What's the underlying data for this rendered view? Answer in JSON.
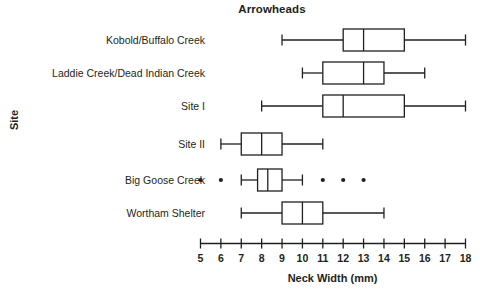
{
  "chart_data": {
    "type": "box",
    "title": "Arrowheads",
    "xlabel": "Neck Width (mm)",
    "ylabel": "Site",
    "xlim": [
      5,
      18
    ],
    "xticks": [
      5,
      6,
      7,
      8,
      9,
      10,
      11,
      12,
      13,
      14,
      15,
      16,
      17,
      18
    ],
    "xtick_labels": [
      "5",
      "6",
      "7",
      "8",
      "9",
      "10",
      "11",
      "12",
      "13",
      "14",
      "15",
      "16",
      "17",
      "18"
    ],
    "grid": false,
    "legend": null,
    "orientation": "horizontal",
    "categories": [
      "Kobold/Buffalo Creek",
      "Laddie Creek/Dead Indian Creek",
      "Site I",
      "Site II",
      "Big Goose Creek",
      "Wortham Shelter"
    ],
    "boxes": [
      {
        "category": "Kobold/Buffalo Creek",
        "whisker_low": 9.0,
        "q1": 12.0,
        "median": 13.0,
        "q3": 15.0,
        "whisker_high": 18.0,
        "outliers": []
      },
      {
        "category": "Laddie Creek/Dead Indian Creek",
        "whisker_low": 10.0,
        "q1": 11.0,
        "median": 13.0,
        "q3": 14.0,
        "whisker_high": 16.0,
        "outliers": []
      },
      {
        "category": "Site I",
        "whisker_low": 8.0,
        "q1": 11.0,
        "median": 12.0,
        "q3": 15.0,
        "whisker_high": 18.0,
        "outliers": []
      },
      {
        "category": "Site II",
        "whisker_low": 6.0,
        "q1": 7.0,
        "median": 8.0,
        "q3": 9.0,
        "whisker_high": 11.0,
        "outliers": []
      },
      {
        "category": "Big Goose Creek",
        "whisker_low": 7.0,
        "q1": 7.8,
        "median": 8.3,
        "q3": 9.0,
        "whisker_high": 10.0,
        "outliers": [
          5.0,
          6.0,
          11.0,
          12.0,
          13.0
        ]
      },
      {
        "category": "Wortham Shelter",
        "whisker_low": 7.0,
        "q1": 9.0,
        "median": 10.0,
        "q3": 11.0,
        "whisker_high": 14.0,
        "outliers": []
      }
    ],
    "colors": {
      "line": "#231f20",
      "box_fill": "#ffffff",
      "outlier": "#231f20",
      "background": "#ffffff"
    }
  }
}
